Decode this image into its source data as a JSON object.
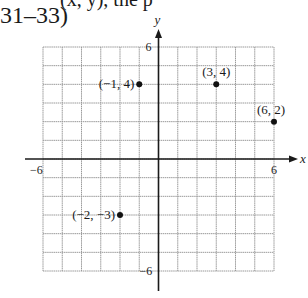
{
  "header": {
    "top_cut_text": "(x, y), the p",
    "problem_label": "31–33)"
  },
  "chart_data": {
    "type": "scatter",
    "title": "",
    "xlabel": "x",
    "ylabel": "y",
    "xlim": [
      -6,
      6
    ],
    "ylim": [
      -6,
      6
    ],
    "grid": true,
    "grid_step": 1,
    "x_tick_labels": [
      "-6",
      "6"
    ],
    "y_tick_labels": [
      "6",
      "-6"
    ],
    "points": [
      {
        "x": -1,
        "y": 4,
        "label": "(−1, 4)",
        "label_pos": "left"
      },
      {
        "x": 3,
        "y": 4,
        "label": "(3, 4)",
        "label_pos": "above"
      },
      {
        "x": 6,
        "y": 2,
        "label": "(6, 2)",
        "label_pos": "above"
      },
      {
        "x": -2,
        "y": -3,
        "label": "(−2, −3)",
        "label_pos": "left"
      }
    ],
    "colors": {
      "axis": "#1a1a1a",
      "grid": "#9a9a9a",
      "point": "#111111"
    }
  }
}
